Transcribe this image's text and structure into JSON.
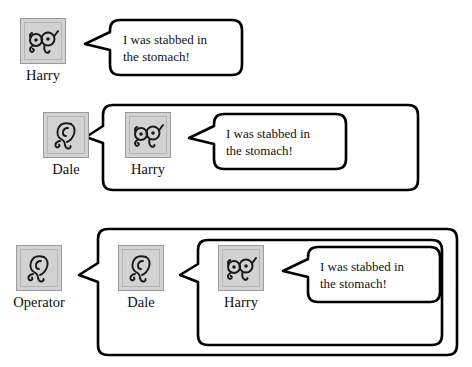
{
  "figure": {
    "background_color": "#ffffff",
    "line_color": "#000000",
    "icon_fill": "#d2d2d2",
    "icon_border": "#9a9a9a",
    "text_color": "#111111",
    "utterance": "I was stabbed in\nthe stomach!"
  },
  "icons": {
    "glasses_name": "glasses-face-icon",
    "ear_name": "ear-icon"
  },
  "rows": [
    {
      "id": "row-1",
      "nesting_depth": 1,
      "actors": [
        {
          "label": "Harry",
          "icon": "glasses-face-icon",
          "role": "speaker"
        }
      ],
      "bubbles": [
        {
          "level": 1,
          "speaker": "Harry",
          "text": "I was stabbed in\nthe stomach!"
        }
      ]
    },
    {
      "id": "row-2",
      "nesting_depth": 2,
      "actors": [
        {
          "label": "Dale",
          "icon": "ear-icon",
          "role": "listener"
        },
        {
          "label": "Harry",
          "icon": "glasses-face-icon",
          "role": "speaker"
        }
      ],
      "bubbles": [
        {
          "level": 1,
          "speaker": "Dale",
          "text": ""
        },
        {
          "level": 2,
          "speaker": "Harry",
          "text": "I was stabbed in\nthe stomach!"
        }
      ]
    },
    {
      "id": "row-3",
      "nesting_depth": 3,
      "actors": [
        {
          "label": "Operator",
          "icon": "ear-icon",
          "role": "listener"
        },
        {
          "label": "Dale",
          "icon": "ear-icon",
          "role": "listener"
        },
        {
          "label": "Harry",
          "icon": "glasses-face-icon",
          "role": "speaker"
        }
      ],
      "bubbles": [
        {
          "level": 1,
          "speaker": "Operator",
          "text": ""
        },
        {
          "level": 2,
          "speaker": "Dale",
          "text": ""
        },
        {
          "level": 3,
          "speaker": "Harry",
          "text": "I was stabbed in\nthe stomach!"
        }
      ]
    }
  ]
}
